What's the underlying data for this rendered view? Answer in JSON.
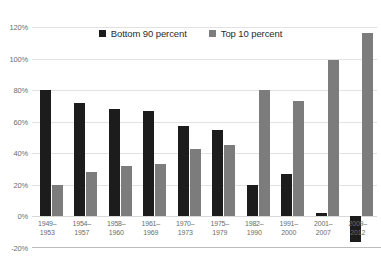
{
  "chart_data": {
    "type": "bar",
    "title": "",
    "subtitle": "",
    "xlabel": "",
    "ylabel": "",
    "ylim": [
      -20,
      120
    ],
    "yticks": [
      "-20%",
      "0%",
      "20%",
      "40%",
      "60%",
      "80%",
      "100%",
      "120%"
    ],
    "ytick_values": [
      -20,
      0,
      20,
      40,
      60,
      80,
      100,
      120
    ],
    "grid": true,
    "legend_position": "top-center",
    "categories": [
      "1949–1953",
      "1954–1957",
      "1958–1960",
      "1961–1969",
      "1970–1973",
      "1975–1979",
      "1982–1990",
      "1991–2000",
      "2001–2007",
      "2009–2012"
    ],
    "category_lines": [
      [
        "1949–",
        "1953"
      ],
      [
        "1954–",
        "1957"
      ],
      [
        "1958–",
        "1960"
      ],
      [
        "1961–",
        "1969"
      ],
      [
        "1970–",
        "1973"
      ],
      [
        "1975–",
        "1979"
      ],
      [
        "1982–",
        "1990"
      ],
      [
        "1991–",
        "2000"
      ],
      [
        "2001–",
        "2007"
      ],
      [
        "2009–",
        "2012"
      ]
    ],
    "series": [
      {
        "name": "Bottom 90 percent",
        "color": "#1c1c1c",
        "values": [
          80,
          72,
          68,
          67,
          57,
          55,
          20,
          27,
          2,
          -16
        ]
      },
      {
        "name": "Top 10 percent",
        "color": "#7c7c7c",
        "values": [
          20,
          28,
          32,
          33,
          43,
          45,
          80,
          73,
          99,
          116
        ]
      }
    ]
  },
  "legend": {
    "entries": [
      {
        "label": "Bottom 90 percent",
        "color": "#1c1c1c"
      },
      {
        "label": "Top 10 percent",
        "color": "#7c7c7c"
      }
    ]
  }
}
